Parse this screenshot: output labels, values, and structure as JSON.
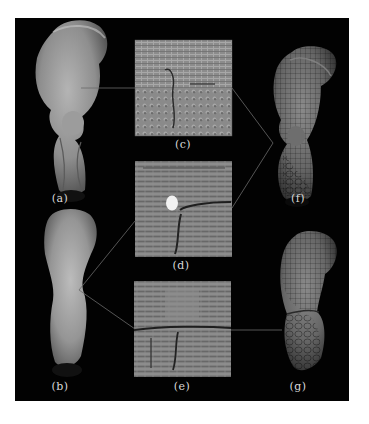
{
  "figure": {
    "background": "#020202",
    "panels": [
      {
        "id": "a",
        "label": "(a)",
        "kind": "smooth-surface-render"
      },
      {
        "id": "b",
        "label": "(b)",
        "kind": "smooth-surface-render"
      },
      {
        "id": "c",
        "label": "(c)",
        "kind": "texture-patch"
      },
      {
        "id": "d",
        "label": "(d)",
        "kind": "texture-patch"
      },
      {
        "id": "e",
        "label": "(e)",
        "kind": "texture-patch"
      },
      {
        "id": "f",
        "label": "(f)",
        "kind": "textured-surface-render"
      },
      {
        "id": "g",
        "label": "(g)",
        "kind": "textured-surface-render"
      }
    ],
    "connectors": [
      {
        "from": "a",
        "to": "c"
      },
      {
        "from": "c",
        "to": "f"
      },
      {
        "from": "d",
        "to": "f"
      },
      {
        "from": "b",
        "to": "d"
      },
      {
        "from": "b",
        "to": "e"
      },
      {
        "from": "e",
        "to": "g"
      }
    ]
  }
}
